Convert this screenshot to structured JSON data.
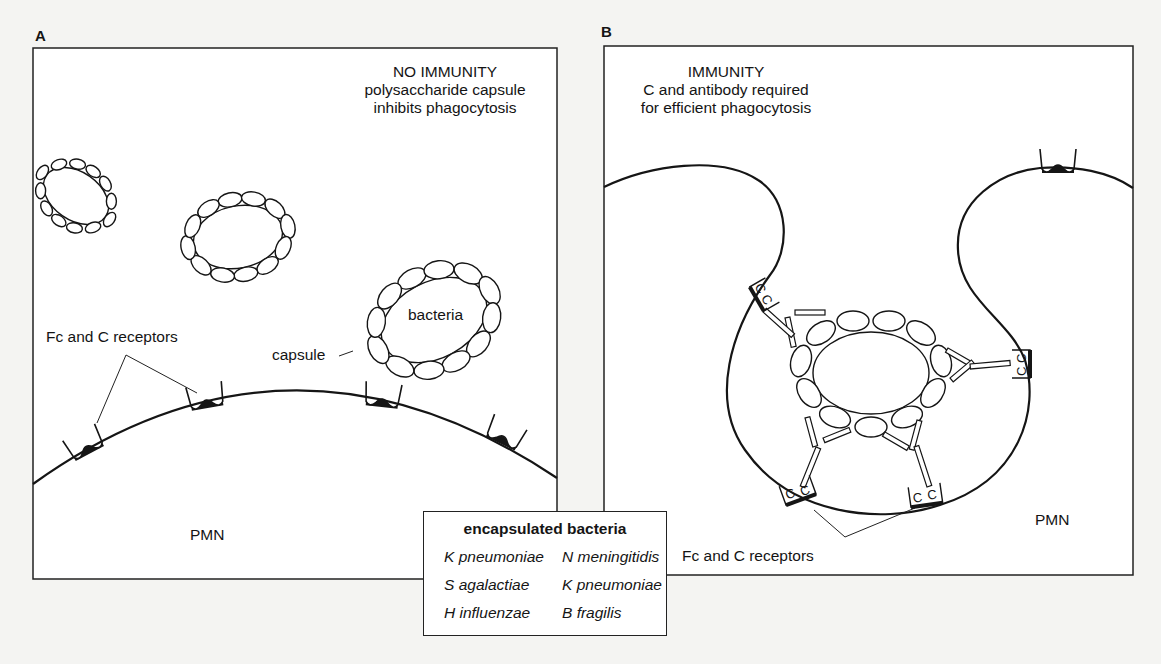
{
  "panel_a": {
    "label": "A",
    "heading": [
      "NO IMMUNITY",
      "polysaccharide capsule",
      "inhibits phagocytosis"
    ],
    "receptors_label": "Fc and C receptors",
    "bacteria_label": "bacteria",
    "capsule_label": "capsule",
    "cell_label": "PMN"
  },
  "panel_b": {
    "label": "B",
    "heading": [
      "IMMUNITY",
      "C and antibody required",
      "for efficient phagocytosis"
    ],
    "receptors_label": "Fc and C receptors",
    "cell_label": "PMN",
    "receptor_glyph": "C"
  },
  "legend": {
    "title": "encapsulated bacteria",
    "items": [
      "K pneumoniae",
      "N meningitidis",
      "S agalactiae",
      "K pneumoniae",
      "H influenzae",
      "B fragilis"
    ]
  },
  "colors": {
    "background": "#f4f4f2",
    "panel": "#ffffff",
    "ink": "#151515"
  }
}
